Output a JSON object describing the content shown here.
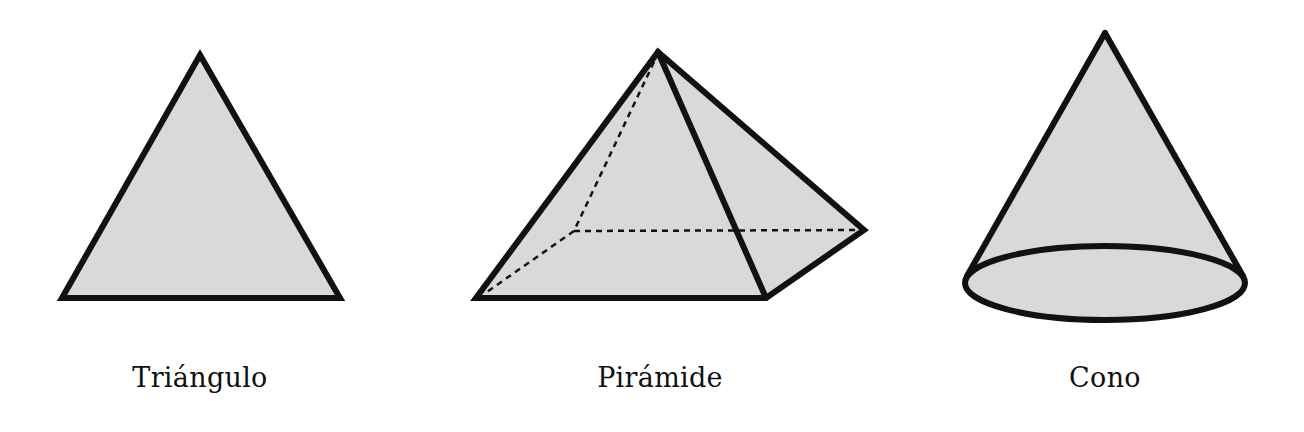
{
  "figure": {
    "colors": {
      "fill": "#d9d9d9",
      "stroke": "#111111",
      "background": "#ffffff",
      "label": "#111111"
    },
    "shapes": [
      {
        "id": "triangle",
        "label": "Triángulo",
        "label_x": 200,
        "points": [
          [
            200,
            55
          ],
          [
            340,
            298
          ],
          [
            62,
            298
          ]
        ]
      },
      {
        "id": "pyramid",
        "label": "Pirámide",
        "label_x": 660,
        "apex": [
          658,
          52
        ],
        "base_front_left": [
          476,
          298
        ],
        "base_front_right": [
          766,
          298
        ],
        "base_back_right": [
          864,
          230
        ],
        "base_back_left_hidden": [
          574,
          231
        ]
      },
      {
        "id": "cone",
        "label": "Cono",
        "label_x": 1105,
        "apex": [
          1105,
          33
        ],
        "base_center": [
          1105,
          283
        ],
        "base_rx": 140,
        "base_ry": 37
      }
    ]
  }
}
